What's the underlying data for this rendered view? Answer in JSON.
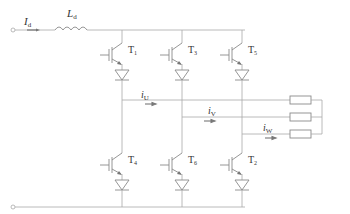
{
  "diagram": {
    "type": "three-phase current source inverter circuit",
    "input": {
      "current_label": "I",
      "current_sub": "d",
      "inductor_label": "L",
      "inductor_sub": "d"
    },
    "switches": [
      {
        "id": "T1",
        "label": "T",
        "sub": "1",
        "position": "upper",
        "phase": "U"
      },
      {
        "id": "T3",
        "label": "T",
        "sub": "3",
        "position": "upper",
        "phase": "V"
      },
      {
        "id": "T5",
        "label": "T",
        "sub": "5",
        "position": "upper",
        "phase": "W"
      },
      {
        "id": "T4",
        "label": "T",
        "sub": "4",
        "position": "lower",
        "phase": "U"
      },
      {
        "id": "T6",
        "label": "T",
        "sub": "6",
        "position": "lower",
        "phase": "V"
      },
      {
        "id": "T2",
        "label": "T",
        "sub": "2",
        "position": "lower",
        "phase": "W"
      }
    ],
    "phase_currents": [
      {
        "label": "i",
        "sub": "U"
      },
      {
        "label": "i",
        "sub": "V"
      },
      {
        "label": "i",
        "sub": "W"
      }
    ],
    "load": {
      "resistors": 3,
      "connection": "star"
    },
    "colors": {
      "wire": "#a8a8a8",
      "device": "#8a8a8a",
      "text": "#333333"
    }
  }
}
